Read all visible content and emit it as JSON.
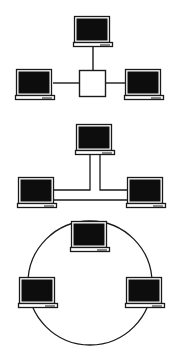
{
  "diagram": {
    "colors": {
      "background": "#ffffff",
      "stroke": "#1a1a1a",
      "screen": "#0d0d0d",
      "screen_bezel": "#ffffff",
      "base_fill": "#ffffff"
    },
    "topologies": [
      {
        "name": "Star topology",
        "hub": {
          "label": "Hub",
          "x": 79,
          "y": 70,
          "w": 26,
          "h": 26
        },
        "nodes": [
          {
            "label": "Computer (top)",
            "x": 73,
            "y": 15
          },
          {
            "label": "Computer (left)",
            "x": 15,
            "y": 68
          },
          {
            "label": "Computer (right)",
            "x": 124,
            "y": 68
          }
        ]
      },
      {
        "name": "Bus topology",
        "nodes": [
          {
            "label": "Computer (top)",
            "x": 75,
            "y": 123
          },
          {
            "label": "Computer (left)",
            "x": 17,
            "y": 176
          },
          {
            "label": "Computer (right)",
            "x": 126,
            "y": 176
          }
        ]
      },
      {
        "name": "Ring topology",
        "ring": {
          "cx": 90,
          "cy": 283,
          "r": 62
        },
        "nodes": [
          {
            "label": "Computer (top)",
            "x": 70,
            "y": 220
          },
          {
            "label": "Computer (left)",
            "x": 18,
            "y": 276
          },
          {
            "label": "Computer (right)",
            "x": 125,
            "y": 276
          }
        ]
      }
    ]
  }
}
